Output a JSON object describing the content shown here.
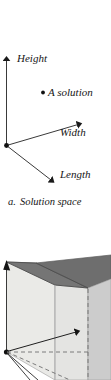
{
  "figure": {
    "caption_letter": "a.",
    "caption_text": "Solution space",
    "panel_a": {
      "name": "solution-space-axes",
      "axes": [
        {
          "id": "height",
          "label": "Height",
          "direction": "up"
        },
        {
          "id": "width",
          "label": "Width",
          "direction": "up-right"
        },
        {
          "id": "length",
          "label": "Length",
          "direction": "down-right"
        }
      ],
      "point": {
        "marker": "bullet-point",
        "label": "A solution"
      },
      "origin_marker": "origin-dot"
    },
    "panel_b": {
      "name": "solution-space-box",
      "description": "3D cuboid solution volume with hidden edges dashed",
      "faces": [
        {
          "id": "top-face",
          "shade": "#757575"
        },
        {
          "id": "front-left-face",
          "shade": "#eaeae7"
        },
        {
          "id": "front-right-face",
          "shade": "#dedede"
        },
        {
          "id": "side-face",
          "shade": "#cccccc"
        }
      ],
      "edge_color": "#5a5a5a",
      "hidden_edge_style": "dashed"
    }
  },
  "colors": {
    "ink": "#161616",
    "background": "#ffffff",
    "line": "#333333",
    "top_face": "#757575",
    "front_face": "#eaeae7",
    "right_face": "#cccccc",
    "dashed_edge": "#777777"
  }
}
